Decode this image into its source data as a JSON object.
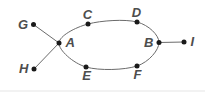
{
  "diagram": {
    "type": "undirected-graph",
    "background": "#ffffff",
    "colors": {
      "node_dot": "#1a1a1a",
      "edge": "#6b6b6b",
      "label": "#4d4d4d"
    },
    "node_radius": 2.5,
    "nodes": [
      {
        "id": "G",
        "label": "G",
        "x": 33.5,
        "y": 24.5,
        "label_pos": "left"
      },
      {
        "id": "H",
        "label": "H",
        "x": 34,
        "y": 69,
        "label_pos": "left"
      },
      {
        "id": "A",
        "label": "A",
        "x": 59,
        "y": 43,
        "label_pos": "right"
      },
      {
        "id": "C",
        "label": "C",
        "x": 88,
        "y": 24,
        "label_pos": "above"
      },
      {
        "id": "D",
        "label": "D",
        "x": 137,
        "y": 22,
        "label_pos": "above"
      },
      {
        "id": "E",
        "label": "E",
        "x": 86,
        "y": 67,
        "label_pos": "below"
      },
      {
        "id": "F",
        "label": "F",
        "x": 137,
        "y": 66,
        "label_pos": "below"
      },
      {
        "id": "B",
        "label": "B",
        "x": 159,
        "y": 42.5,
        "label_pos": "left"
      },
      {
        "id": "I",
        "label": "I",
        "x": 184,
        "y": 42,
        "label_pos": "right"
      }
    ],
    "edges": [
      {
        "from": "G",
        "to": "A"
      },
      {
        "from": "H",
        "to": "A"
      },
      {
        "from": "B",
        "to": "I"
      }
    ],
    "cycle": [
      "A",
      "C",
      "D",
      "B",
      "F",
      "E"
    ]
  }
}
